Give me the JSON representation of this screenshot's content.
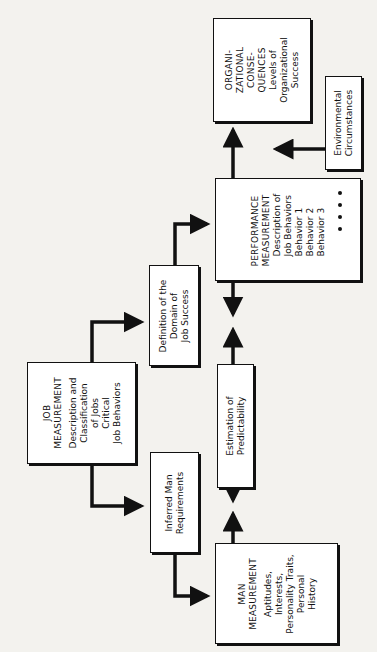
{
  "diagram": {
    "orientation": "rotated-90-ccw",
    "boxes": {
      "organizational": {
        "title_lines": [
          "ORGANI-",
          "ZATIONAL",
          "CONSE-",
          "QUENCES"
        ],
        "body_lines": [
          "Levels of",
          "Organizational",
          "Success"
        ]
      },
      "environmental": {
        "body_lines": [
          "Environmental",
          "Circumstances"
        ]
      },
      "performance": {
        "title_lines": [
          "PERFORMANCE",
          "MEASUREMENT"
        ],
        "body_lines": [
          "Description of",
          "Job Behaviors",
          "Behavior 1",
          "Behavior 2",
          "Behavior 3"
        ],
        "ellipsis": "• • • •"
      },
      "definition": {
        "body_lines": [
          "Definition of the",
          "Domain of",
          "Job Success"
        ]
      },
      "estimation": {
        "body_lines": [
          "Estimation of",
          "Predictability"
        ]
      },
      "job": {
        "title_lines": [
          "JOB",
          "MEASUREMENT"
        ],
        "body_lines": [
          "Description and",
          "Classification",
          "of Jobs",
          "Critical",
          "Job Behaviors"
        ]
      },
      "inferred": {
        "body_lines": [
          "Inferred Man",
          "Requirements"
        ]
      },
      "man": {
        "title_lines": [
          "MAN",
          "MEASUREMENT"
        ],
        "body_lines": [
          "Aptitudes,",
          "Interests,",
          "Personality Traits,",
          "Personal",
          "History"
        ]
      }
    },
    "connections": [
      {
        "from": "job",
        "to": "definition"
      },
      {
        "from": "job",
        "to": "inferred"
      },
      {
        "from": "definition",
        "to": "performance"
      },
      {
        "from": "inferred",
        "to": "man"
      },
      {
        "from": "performance",
        "to": "organizational"
      },
      {
        "from": "environmental",
        "to": "organizational"
      },
      {
        "from": "performance",
        "to": "estimation"
      },
      {
        "from": "estimation",
        "to": "performance"
      },
      {
        "from": "estimation",
        "to": "man"
      },
      {
        "from": "man",
        "to": "estimation"
      }
    ],
    "colors": {
      "ink": "#111111",
      "paper": "#f3f2ee",
      "box_fill": "#ffffff"
    }
  }
}
